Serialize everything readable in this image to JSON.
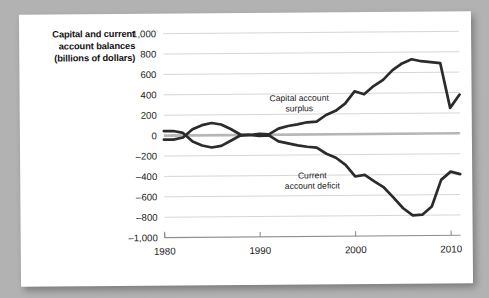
{
  "figure": {
    "axis_title_lines": [
      "Capital and current",
      "account balances",
      "(billions of dollars)"
    ],
    "axis_title_text": "Capital and current account balances (billions of dollars)"
  },
  "colors": {
    "page_background": "#b2b2b2",
    "card_background": "#ffffff",
    "line": "#2b2b2b",
    "gridline": "#d2d2d2",
    "zeroline": "#b6b6b6",
    "axis": "#8f8f8f",
    "text": "#111111"
  },
  "chart_data": {
    "type": "line",
    "title": "Capital and current account balances (billions of dollars)",
    "xlabel": "",
    "ylabel": "Capital and current account balances (billions of dollars)",
    "xlim": [
      1980,
      2011
    ],
    "ylim": [
      -1000,
      1000
    ],
    "grid": true,
    "legend": "annotations-on-plot",
    "ytick_labels": [
      "1,000",
      "800",
      "600",
      "400",
      "200",
      "0",
      "–200",
      "–400",
      "–600",
      "–800",
      "–1,000"
    ],
    "ytick_values": [
      1000,
      800,
      600,
      400,
      200,
      0,
      -200,
      -400,
      -600,
      -800,
      -1000
    ],
    "xtick_labels": [
      "1980",
      "1990",
      "2000",
      "2010"
    ],
    "xtick_values": [
      1980,
      1990,
      2000,
      2010
    ],
    "annotations": [
      {
        "text_lines": [
          "Capital account",
          "surplus"
        ],
        "text": "Capital account surplus",
        "x": 1994.2,
        "y": 330
      },
      {
        "text_lines": [
          "Current",
          "account deficit"
        ],
        "text": "Current account deficit",
        "x": 1995.5,
        "y": -430
      }
    ],
    "x": [
      1980,
      1981,
      1982,
      1983,
      1984,
      1985,
      1986,
      1987,
      1988,
      1989,
      1990,
      1991,
      1992,
      1993,
      1994,
      1995,
      1996,
      1997,
      1998,
      1999,
      2000,
      2001,
      2002,
      2003,
      2004,
      2005,
      2006,
      2007,
      2008,
      2009,
      2010,
      2011
    ],
    "series": [
      {
        "name": "Capital account surplus",
        "values": [
          45,
          45,
          25,
          -60,
          -100,
          -120,
          -105,
          -55,
          -5,
          0,
          10,
          5,
          60,
          85,
          100,
          120,
          125,
          190,
          230,
          300,
          420,
          390,
          470,
          530,
          625,
          690,
          730,
          710,
          700,
          690,
          250,
          380
        ]
      },
      {
        "name": "Current account deficit",
        "values": [
          -40,
          -40,
          -20,
          60,
          100,
          120,
          105,
          60,
          5,
          0,
          -10,
          -5,
          -65,
          -85,
          -105,
          -120,
          -130,
          -190,
          -230,
          -300,
          -415,
          -400,
          -465,
          -525,
          -625,
          -730,
          -800,
          -795,
          -715,
          -455,
          -375,
          -400
        ]
      }
    ]
  }
}
